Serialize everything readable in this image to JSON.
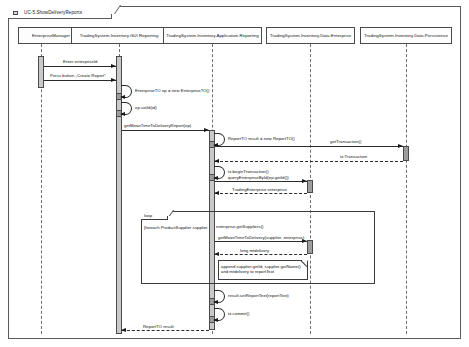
{
  "diagram": {
    "title": "UC-5.ShowDeliveryReports",
    "frame_icon": "uml-frame-icon",
    "type": "uml-sequence-diagram"
  },
  "lifelines": [
    {
      "id": "enterprise-manager",
      "label": "EnterpriseManager"
    },
    {
      "id": "gui-reporting",
      "label": "TradingSystem.Inventory.GUI.Reporting"
    },
    {
      "id": "application-reporting",
      "label": "TradingSystem.Inventory.Application.Reporting"
    },
    {
      "id": "data-enterprise",
      "label": "TradingSystem.Inventory.Data.Enterprise"
    },
    {
      "id": "data-persistence",
      "label": "TradingSystem.Inventory.Data.Persistence"
    }
  ],
  "messages": [
    {
      "id": "m1",
      "label": "Enter enterpriseId",
      "kind": "call"
    },
    {
      "id": "m2",
      "label": "Press button „Create Report“",
      "kind": "call"
    },
    {
      "id": "m3",
      "label": "EnterpriseTO ep = new EnterpriseTO()",
      "kind": "self"
    },
    {
      "id": "m4",
      "label": "ep.setId(id)",
      "kind": "self"
    },
    {
      "id": "m5",
      "label": "getMeanTimeToDeliveryReport(ep)",
      "kind": "call"
    },
    {
      "id": "m6",
      "label": "ReportTO result = new ReportTO()",
      "kind": "self"
    },
    {
      "id": "m7",
      "label": "getTransaction()",
      "kind": "call"
    },
    {
      "id": "m8",
      "label": "tx:Transaction",
      "kind": "return"
    },
    {
      "id": "m9",
      "label": "tx.beginTransaction()",
      "kind": "self"
    },
    {
      "id": "m10",
      "label": "queryEnterpriseById(ep.getId())",
      "kind": "call"
    },
    {
      "id": "m11",
      "label": "TradingEnterprise enterprise",
      "kind": "return"
    },
    {
      "id": "m12",
      "label": "enterprise.getSuppliers()",
      "kind": "self"
    },
    {
      "id": "m13",
      "label": "getMeanTimeToDelivery(supplier, enterprise)",
      "kind": "call"
    },
    {
      "id": "m14",
      "label": "long mtdelivery",
      "kind": "return"
    },
    {
      "id": "m15",
      "label": "result.setReportText(reportText)",
      "kind": "self"
    },
    {
      "id": "m16",
      "label": "tx.commit()",
      "kind": "self"
    },
    {
      "id": "m17",
      "label": "ReportTO result",
      "kind": "return"
    }
  ],
  "fragments": [
    {
      "id": "loop-suppliers",
      "operator": "loop",
      "guard": "[foreach ProductSupplier supplier"
    }
  ],
  "notes": [
    {
      "id": "note-append-report",
      "text": "append supplier.getId, supplier.getName()\nand mtdelivery to reportText"
    }
  ]
}
